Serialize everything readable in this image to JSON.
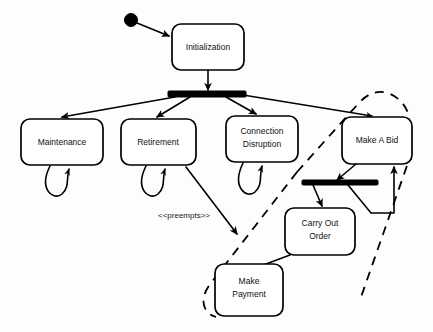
{
  "diagram": {
    "kind": "uml-statechart",
    "title": "",
    "colors": {
      "stroke": "#000000",
      "fill": "#ffffff",
      "background": "#fdfdfd",
      "text": "#111111"
    },
    "start_node": {
      "name": "initial-pseudostate",
      "cx": 131,
      "cy": 20,
      "r": 6.5
    },
    "states": [
      {
        "id": "initialization",
        "label": "Initialization",
        "lines": [
          "Initialization"
        ],
        "x": 172,
        "y": 24,
        "w": 72,
        "h": 46
      },
      {
        "id": "maintenance",
        "label": "Maintenance",
        "lines": [
          "Maintenance"
        ],
        "x": 21,
        "y": 119,
        "w": 82,
        "h": 46
      },
      {
        "id": "retirement",
        "label": "Retirement",
        "lines": [
          "Retirement"
        ],
        "x": 121,
        "y": 119,
        "w": 75,
        "h": 46
      },
      {
        "id": "connection-disruption",
        "label": "Connection Disruption",
        "lines": [
          "Connection",
          "Disruption"
        ],
        "x": 226,
        "y": 116,
        "w": 72,
        "h": 46
      },
      {
        "id": "make-a-bid",
        "label": "Make A Bid",
        "lines": [
          "Make A Bid"
        ],
        "x": 342,
        "y": 117,
        "w": 70,
        "h": 47
      },
      {
        "id": "carry-out-order",
        "label": "Carry Out Order",
        "lines": [
          "Carry Out",
          "Order"
        ],
        "x": 285,
        "y": 208,
        "w": 70,
        "h": 47
      },
      {
        "id": "make-payment",
        "label": "Make Payment",
        "lines": [
          "Make",
          "Payment"
        ],
        "x": 215,
        "y": 264,
        "w": 68,
        "h": 52
      }
    ],
    "bars": [
      {
        "id": "fork-bar-main",
        "name": "fork-bar-initialization",
        "x": 168,
        "y": 91,
        "w": 78,
        "h": 6
      },
      {
        "id": "fork-bar-secondary",
        "name": "fork-bar-make-a-bid",
        "x": 302,
        "y": 180,
        "w": 76,
        "h": 5
      }
    ],
    "transitions": [
      {
        "id": "t-start",
        "from": "initial-pseudostate",
        "to": "initialization",
        "label": ""
      },
      {
        "id": "t-init-fork",
        "from": "initialization",
        "to": "fork-bar-main",
        "label": ""
      },
      {
        "id": "t-fork-maint",
        "from": "fork-bar-main",
        "to": "maintenance",
        "label": ""
      },
      {
        "id": "t-fork-retire",
        "from": "fork-bar-main",
        "to": "retirement",
        "label": ""
      },
      {
        "id": "t-fork-conn",
        "from": "fork-bar-main",
        "to": "connection-disruption",
        "label": ""
      },
      {
        "id": "t-fork-bid",
        "from": "fork-bar-main",
        "to": "make-a-bid",
        "label": ""
      },
      {
        "id": "t-maint-self",
        "from": "maintenance",
        "to": "maintenance",
        "label": ""
      },
      {
        "id": "t-retire-self",
        "from": "retirement",
        "to": "retirement",
        "label": ""
      },
      {
        "id": "t-conn-self",
        "from": "connection-disruption",
        "to": "connection-disruption",
        "label": ""
      },
      {
        "id": "t-preempts",
        "from": "retirement",
        "to": "make-payment",
        "label": "<<preempts>>"
      },
      {
        "id": "t-bid-fork2",
        "from": "make-a-bid",
        "to": "fork-bar-secondary",
        "label": ""
      },
      {
        "id": "t-fork2-carry",
        "from": "fork-bar-secondary",
        "to": "carry-out-order",
        "label": ""
      },
      {
        "id": "t-fork2-bid",
        "from": "fork-bar-secondary",
        "to": "make-a-bid",
        "label": ""
      },
      {
        "id": "t-carry-pay",
        "from": "carry-out-order",
        "to": "make-payment",
        "label": ""
      }
    ],
    "region": {
      "id": "bidding-region",
      "name": "dashed-region-boundary",
      "style": "dashed",
      "encloses": [
        "make-a-bid",
        "carry-out-order",
        "make-payment",
        "fork-bar-secondary"
      ]
    },
    "labels": {
      "preempts": "<<preempts>>"
    }
  }
}
